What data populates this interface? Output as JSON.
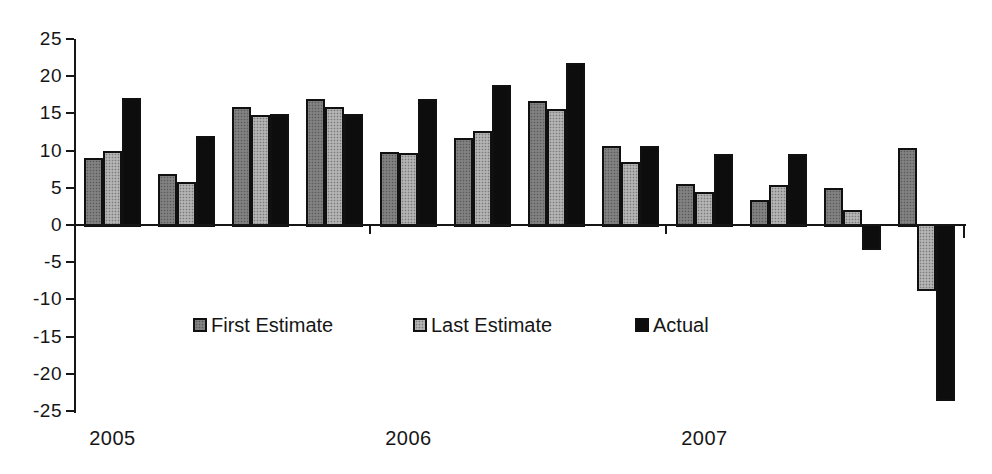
{
  "chart_data": {
    "type": "bar",
    "title": "",
    "categories": [
      "2005",
      "",
      "",
      "",
      "2006",
      "",
      "",
      "",
      "2007",
      "",
      "",
      ""
    ],
    "series": [
      {
        "name": "First Estimate",
        "color": "#828282",
        "values": [
          9,
          6.9,
          15.9,
          16.9,
          9.8,
          11.7,
          16.7,
          10.6,
          5.5,
          3.4,
          5,
          10.3
        ]
      },
      {
        "name": "Last Estimate",
        "color": "#b4b4b4",
        "values": [
          10,
          5.8,
          14.8,
          15.8,
          9.7,
          12.7,
          15.6,
          8.5,
          4.4,
          5.4,
          2,
          -8.8
        ]
      },
      {
        "name": "Actual",
        "color": "#0d0d0d",
        "values": [
          17.1,
          12,
          14.9,
          14.9,
          16.9,
          18.8,
          21.8,
          10.6,
          9.6,
          9.6,
          -3.2,
          -23.5
        ]
      }
    ],
    "ylim": [
      -25,
      25
    ],
    "yticks": [
      25,
      20,
      15,
      10,
      5,
      0,
      -5,
      -10,
      -15,
      -20,
      -25
    ],
    "xlabel": "",
    "ylabel": "",
    "grid": false,
    "legend_position": "inside-lower-left",
    "year_labels": [
      "2005",
      "2006",
      "2007"
    ]
  },
  "colors": {
    "axis": "#161616",
    "text": "#161616",
    "background": "#ffffff"
  }
}
